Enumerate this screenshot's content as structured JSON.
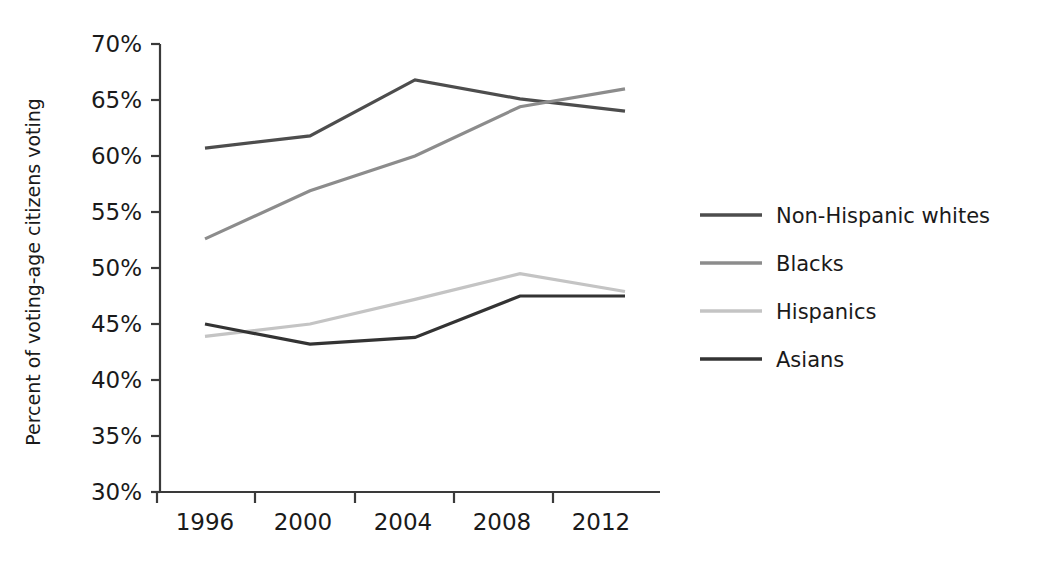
{
  "chart_data": {
    "type": "line",
    "title": "",
    "xlabel": "",
    "ylabel": "Percent of voting-age citizens voting",
    "categories": [
      "1996",
      "2000",
      "2004",
      "2008",
      "2012"
    ],
    "x": [
      1996,
      2000,
      2004,
      2008,
      2012
    ],
    "xlim": [
      1996,
      2012
    ],
    "ylim": [
      30,
      70
    ],
    "ytick_labels": [
      "70%",
      "65%",
      "60%",
      "55%",
      "50%",
      "45%",
      "40%",
      "35%",
      "30%"
    ],
    "ytick_values": [
      70,
      65,
      60,
      55,
      50,
      45,
      40,
      35,
      30
    ],
    "ytick_format": "percent",
    "grid": false,
    "legend_position": "right",
    "series": [
      {
        "name": "Non-Hispanic whites",
        "color": "#4d4d4d",
        "values": [
          60.7,
          61.8,
          66.8,
          65.1,
          64.0
        ]
      },
      {
        "name": "Blacks",
        "color": "#8c8c8c",
        "values": [
          52.6,
          56.9,
          60.0,
          64.4,
          66.0
        ]
      },
      {
        "name": "Hispanics",
        "color": "#c4c4c4",
        "values": [
          43.9,
          45.0,
          47.2,
          49.5,
          47.9
        ]
      },
      {
        "name": "Asians",
        "color": "#333333",
        "values": [
          45.0,
          43.2,
          43.8,
          47.5,
          47.5
        ]
      }
    ]
  }
}
